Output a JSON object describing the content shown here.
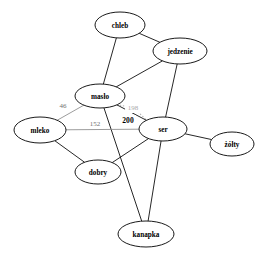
{
  "chart_data": {
    "type": "diagram",
    "subtype": "node-link-graph",
    "title": "",
    "directed": false,
    "background": "#ffffff",
    "node_shape": "ellipse",
    "node_fill": "#ffffff",
    "node_stroke": "#000000",
    "nodes": [
      {
        "id": "chleb",
        "label": "chleb",
        "x": 120,
        "y": 25,
        "rx": 25,
        "ry": 13
      },
      {
        "id": "jedzenie",
        "label": "jedzenie",
        "x": 180,
        "y": 51,
        "rx": 27,
        "ry": 13
      },
      {
        "id": "maslo",
        "label": "masło",
        "x": 100,
        "y": 96,
        "rx": 25,
        "ry": 12
      },
      {
        "id": "mleko",
        "label": "mleko",
        "x": 40,
        "y": 130,
        "rx": 26,
        "ry": 13
      },
      {
        "id": "ser",
        "label": "ser",
        "x": 163,
        "y": 129,
        "rx": 24,
        "ry": 12
      },
      {
        "id": "zolty",
        "label": "żółty",
        "x": 232,
        "y": 144,
        "rx": 22,
        "ry": 12
      },
      {
        "id": "dobry",
        "label": "dobry",
        "x": 98,
        "y": 172,
        "rx": 23,
        "ry": 12
      },
      {
        "id": "kanapka",
        "label": "kanapka",
        "x": 146,
        "y": 234,
        "rx": 28,
        "ry": 13
      }
    ],
    "edges": [
      {
        "source": "chleb",
        "target": "jedzenie",
        "weight": null,
        "style": "solid",
        "color": "#000000"
      },
      {
        "source": "chleb",
        "target": "maslo",
        "weight": null,
        "style": "solid",
        "color": "#000000"
      },
      {
        "source": "jedzenie",
        "target": "maslo",
        "weight": null,
        "style": "solid",
        "color": "#000000"
      },
      {
        "source": "jedzenie",
        "target": "ser",
        "weight": null,
        "style": "solid",
        "color": "#000000"
      },
      {
        "source": "maslo",
        "target": "mleko",
        "weight": "46",
        "style": "solid",
        "color": "#8a8a8a",
        "label_x": 63,
        "label_y": 106,
        "label_emphasis": false
      },
      {
        "source": "maslo",
        "target": "ser",
        "weight": "198",
        "style": "dotted",
        "color": "#b4b4b4",
        "label_x": 133,
        "label_y": 108,
        "label_emphasis": false,
        "label_faint": true
      },
      {
        "source": "maslo",
        "target": "ser",
        "weight": "200",
        "style": "solid",
        "color": "#000000",
        "label_x": 128,
        "label_y": 120,
        "label_emphasis": true
      },
      {
        "source": "maslo",
        "target": "kanapka",
        "weight": null,
        "style": "solid",
        "color": "#000000"
      },
      {
        "source": "mleko",
        "target": "ser",
        "weight": "152",
        "style": "solid",
        "color": "#8a8a8a",
        "label_x": 95,
        "label_y": 124,
        "label_emphasis": false
      },
      {
        "source": "mleko",
        "target": "dobry",
        "weight": null,
        "style": "solid",
        "color": "#000000"
      },
      {
        "source": "ser",
        "target": "dobry",
        "weight": null,
        "style": "solid",
        "color": "#000000"
      },
      {
        "source": "ser",
        "target": "zolty",
        "weight": null,
        "style": "solid",
        "color": "#000000"
      },
      {
        "source": "ser",
        "target": "kanapka",
        "weight": null,
        "style": "solid",
        "color": "#000000"
      }
    ],
    "edge_labels": [
      "46",
      "198",
      "200",
      "152"
    ],
    "node_labels": [
      "chleb",
      "jedzenie",
      "masło",
      "mleko",
      "ser",
      "żółty",
      "dobry",
      "kanapka"
    ]
  }
}
